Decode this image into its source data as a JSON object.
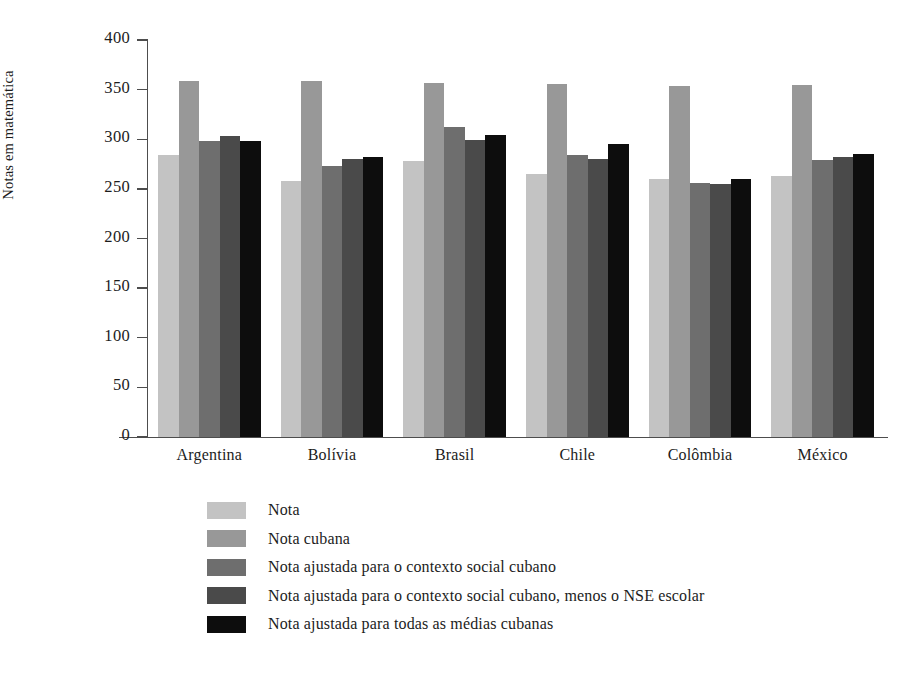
{
  "chart_data": {
    "type": "bar",
    "title": "",
    "subtitle": "",
    "xlabel": "",
    "ylabel": "Notas em matemática",
    "ylim": [
      0,
      400
    ],
    "yticks": [
      0,
      50,
      100,
      150,
      200,
      250,
      300,
      350,
      400
    ],
    "ytick_labels": [
      "0",
      "50",
      "100",
      "150",
      "200",
      "250",
      "300",
      "350",
      "400"
    ],
    "grid": false,
    "legend_position": "below-axes-left",
    "categories": [
      "Argentina",
      "Bolívia",
      "Brasil",
      "Chile",
      "Colômbia",
      "México"
    ],
    "series": [
      {
        "name": "Nota",
        "color": "#c3c3c3",
        "values": [
          284,
          258,
          278,
          265,
          260,
          263
        ]
      },
      {
        "name": "Nota cubana",
        "color": "#989898",
        "values": [
          359,
          359,
          357,
          356,
          354,
          355
        ]
      },
      {
        "name": "Nota ajustada para o contexto social cubano",
        "color": "#6e6e6e",
        "values": [
          298,
          273,
          312,
          284,
          256,
          279
        ]
      },
      {
        "name": "Nota ajustada para o contexto social cubano, menos o NSE escolar",
        "color": "#4a4a4a",
        "values": [
          303,
          280,
          299,
          280,
          255,
          282
        ]
      },
      {
        "name": "Nota ajustada para todas as médias cubanas",
        "color": "#0d0d0d",
        "values": [
          298,
          282,
          304,
          295,
          260,
          285
        ]
      }
    ]
  },
  "colors": {
    "axis": "#4d4d4d",
    "text": "#1c1c1c",
    "background": "#ffffff"
  }
}
